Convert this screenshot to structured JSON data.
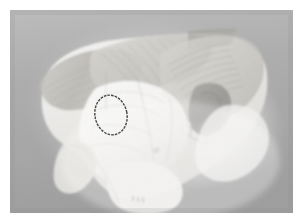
{
  "page": {
    "background_color": "#ffffff",
    "plate_background_color": "#ababab",
    "width": 302,
    "height": 224
  },
  "photo": {
    "kind": "anatomical-dissection-photograph",
    "color_mode": "grayscale",
    "subject": "Anatomical dissection specimen",
    "frame": {
      "x": 10,
      "y": 10,
      "width": 283,
      "height": 203
    },
    "background": {
      "type": "vertical-gradient",
      "top_color": "#b7b7b7",
      "mid_color": "#aaaaaa",
      "bottom_color": "#a3a3a3"
    },
    "halo": {
      "description": "bright diffuse glow surrounding the specimen",
      "color": "#f2f2f2",
      "center_x": 150,
      "center_y": 105,
      "radius": 120
    },
    "specimen": {
      "fill_light": "#f4f3f1",
      "fill_mid": "#dedcd8",
      "fill_shadow": "#c4c2be",
      "fill_dark": "#a9a7a3",
      "outline_color": "#9c9a96"
    },
    "striation_color": "#b9b7b2",
    "regions": [
      {
        "name": "upper-left-muscle-band",
        "tone": "#c7c5c0"
      },
      {
        "name": "upper-central-striated-sheet",
        "tone": "#d4d2ce"
      },
      {
        "name": "upper-right-fan-striations",
        "tone": "#cfcdc8"
      },
      {
        "name": "central-pale-body",
        "tone": "#f0efed"
      },
      {
        "name": "mid-right-dark-recess",
        "tone": "#9b9995"
      },
      {
        "name": "lower-bony-process",
        "tone": "#eceae7"
      },
      {
        "name": "lower-left-flange",
        "tone": "#e6e4e0"
      }
    ]
  },
  "annotation": {
    "type": "ellipse-marker",
    "label": "region-of-interest",
    "stroke_color": "#2b2b2b",
    "stroke_width": 1.4,
    "center_x": 111,
    "center_y": 115,
    "radius_x": 16,
    "radius_y": 20,
    "rotation_deg": -12
  },
  "caption": ""
}
